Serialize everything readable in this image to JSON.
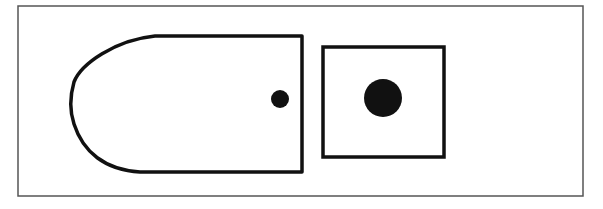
{
  "diagram": {
    "type": "line-drawing",
    "background": "#ffffff",
    "stroke_color": "#111111",
    "frame_color": "#555555",
    "frame": {
      "x": 18,
      "y": 6,
      "width": 565,
      "height": 190
    },
    "shapes": [
      {
        "id": "bullet-shape",
        "kind": "rounded-left-rectangle",
        "x_left": 71,
        "x_right": 302,
        "y_top": 36,
        "y_bottom": 172,
        "contains": "small-dot"
      },
      {
        "id": "square-shape",
        "kind": "square",
        "x": 323,
        "y": 47,
        "width": 121,
        "height": 110,
        "contains": "large-dot"
      }
    ],
    "dots": [
      {
        "id": "small-dot",
        "cx": 280,
        "cy": 99,
        "r": 9
      },
      {
        "id": "large-dot",
        "cx": 383,
        "cy": 98,
        "r": 19
      }
    ]
  }
}
